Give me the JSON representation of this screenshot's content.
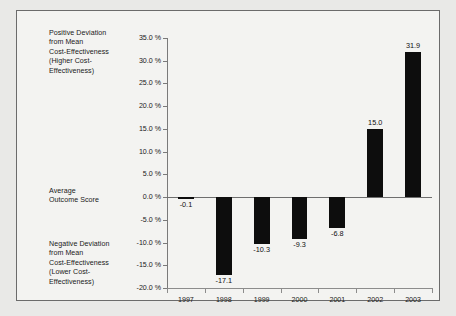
{
  "annotations": {
    "positive": "Positive Deviation\nfrom Mean\nCost-Effectiveness\n(Higher Cost-\nEffectiveness)",
    "average": "Average\nOutcome Score",
    "negative": "Negative Deviation\nfrom Mean\nCost-Effectiveness\n(Lower Cost-\nEffectiveness)"
  },
  "colors": {
    "bar": "#0d0d0d",
    "axis": "#7a7a7a",
    "page_background": "#e9e9e7",
    "plot_background": "#f3f3f1",
    "frame_border": "#6b6b6b",
    "text": "#1a1a1a"
  },
  "chart_data": {
    "type": "bar",
    "title": "",
    "xlabel": "",
    "ylabel": "",
    "categories": [
      "1997",
      "1998",
      "1999",
      "2000",
      "2001",
      "2002",
      "2003"
    ],
    "values": [
      -0.1,
      -17.1,
      -10.3,
      -9.3,
      -6.8,
      15.0,
      31.9
    ],
    "value_labels": [
      "-0.1",
      "-17.1",
      "-10.3",
      "-9.3",
      "-6.8",
      "15.0",
      "31.9"
    ],
    "ylim": [
      -20.0,
      35.0
    ],
    "ytick_values": [
      35.0,
      30.0,
      25.0,
      20.0,
      15.0,
      10.0,
      5.0,
      0.0,
      -5.0,
      -10.0,
      -15.0,
      -20.0
    ],
    "ytick_labels": [
      "35.0 %",
      "30.0 %",
      "25.0 %",
      "20.0 %",
      "15.0 %",
      "10.0 %",
      "5.0 %",
      "0.0 %",
      "-5.0 %",
      "-10.0 %",
      "-15.0 %",
      "-20.0 %"
    ],
    "grid": false,
    "legend": false,
    "zero_line": 0.0
  }
}
